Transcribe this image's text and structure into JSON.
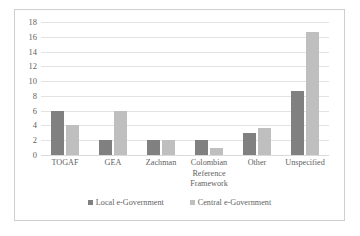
{
  "chart_data": {
    "type": "bar",
    "title": "",
    "subtitle": "",
    "xlabel": "",
    "ylabel": "",
    "ylim": [
      0,
      18
    ],
    "ytick_step": 2,
    "yticks": [
      18,
      16,
      14,
      12,
      10,
      8,
      6,
      4,
      2,
      0
    ],
    "grid": true,
    "legend_position": "bottom",
    "categories": [
      "TOGAF",
      "GEA",
      "Zachman",
      "Colombian Reference Framework",
      "Other",
      "Unspecified"
    ],
    "category_lines": [
      [
        "TOGAF"
      ],
      [
        "GEA"
      ],
      [
        "Zachman"
      ],
      [
        "Colombian",
        "Reference",
        "Framework"
      ],
      [
        "Other"
      ],
      [
        "Unspecified"
      ]
    ],
    "series": [
      {
        "name": "Local e-Government",
        "color": "#808080",
        "values": [
          6,
          2,
          2,
          2,
          3,
          8.6
        ]
      },
      {
        "name": "Central e-Government",
        "color": "#bfbfbf",
        "values": [
          4,
          6,
          2,
          1,
          3.7,
          16.7
        ]
      }
    ]
  },
  "colors": {
    "local": "#808080",
    "central": "#bfbfbf",
    "gridline": "#e3e3e3",
    "border": "#cfcfcf",
    "text": "#5f5f5f",
    "background": "#ffffff"
  }
}
